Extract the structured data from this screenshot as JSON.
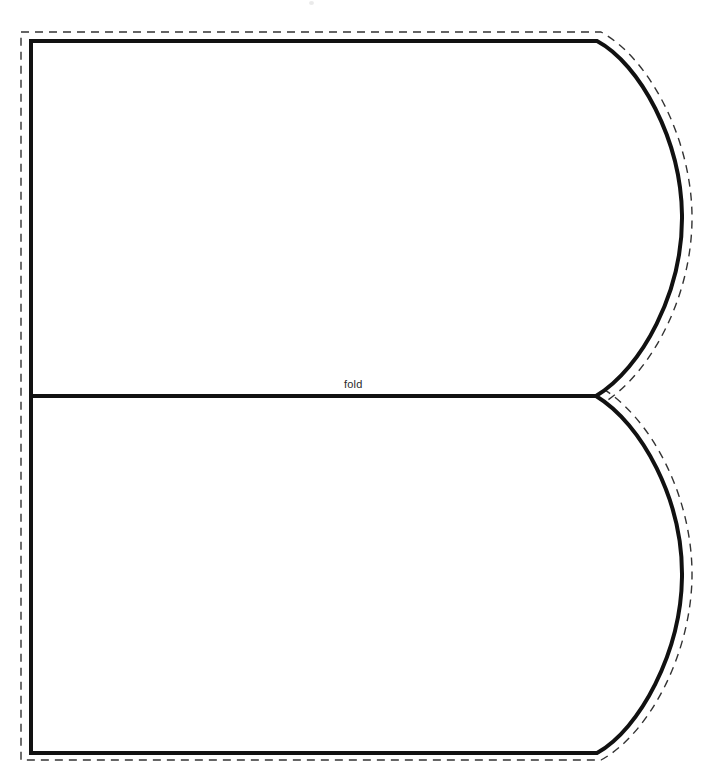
{
  "canvas": {
    "width": 717,
    "height": 783,
    "background_color": "#ffffff"
  },
  "document": {
    "type": "sewing-pattern-template",
    "description": "Printable pattern piece with cut line, seam-allowance line and fold line"
  },
  "labels": {
    "fold": "fold"
  },
  "styles": {
    "cut_line_color": "#111111",
    "cut_line_width": 4,
    "seam_line_color": "#333333",
    "seam_line_width": 1.4,
    "seam_dash": "8 6",
    "fold_line_color": "#111111",
    "fold_line_width": 4,
    "fold_label_color": "#2a2a2a"
  },
  "geometry": {
    "cut_outline_path": "M 31,41 L 597,41 C 640,64 681,140 682,215 C 683,292 642,368 596,396 C 642,424 683,500 682,577 C 681,652 640,729 597,753 L 31,753 Z",
    "seam_outline_path": "M 21,32 L 601,32 C 649,58 691,138 692,215 C 693,296 650,376 600,405 L 596,396 L 600,387 C 650,416 693,496 692,577 C 691,654 649,734 601,760 L 21,760 Z",
    "fold_line": {
      "x1": 31,
      "y1": 396,
      "x2": 596,
      "y2": 396
    },
    "fold_label_position": {
      "x": 344,
      "y": 379
    }
  },
  "chart_data": {
    "type": "table",
    "categories": [
      "top-left-corner",
      "top-right-tangent",
      "upper-lobe-widest",
      "fold-notch-center",
      "lower-lobe-widest",
      "bottom-right-tangent",
      "bottom-left-corner"
    ],
    "series": [
      {
        "name": "x",
        "values": [
          31,
          597,
          682,
          596,
          680,
          597,
          31
        ]
      },
      {
        "name": "y",
        "values": [
          41,
          41,
          215,
          396,
          577,
          753,
          753
        ]
      }
    ],
    "xlabel": "x (px)",
    "ylabel": "y (px)",
    "xlim": [
      0,
      717
    ],
    "ylim": [
      0,
      783
    ]
  }
}
